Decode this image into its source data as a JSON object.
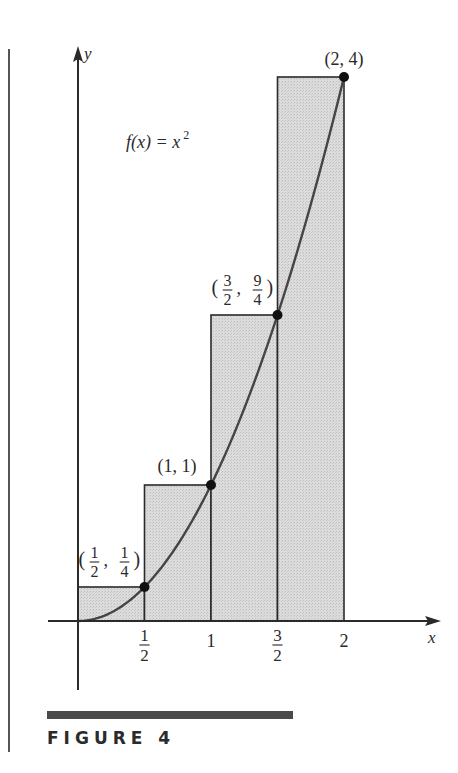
{
  "figure": {
    "caption": "FIGURE 4",
    "function_label": "f(x) = x²",
    "function_label_parts": {
      "lhs": "f(x) = x",
      "exp": "2"
    },
    "axis_labels": {
      "x": "x",
      "y": "y"
    },
    "colors": {
      "fill": "#d6d6d6",
      "stroke": "#2a2a2a",
      "curve": "#444444",
      "bar": "#4a4a4a"
    }
  },
  "chart_data": {
    "type": "area",
    "title": "",
    "function": "f(x) = x^2",
    "xlabel": "x",
    "ylabel": "y",
    "xlim": [
      0,
      2
    ],
    "ylim": [
      0,
      4
    ],
    "grid": false,
    "legend": null,
    "x_ticks": [
      {
        "value": 0.5,
        "num": "1",
        "den": "2"
      },
      {
        "value": 1,
        "label": "1"
      },
      {
        "value": 1.5,
        "num": "3",
        "den": "2"
      },
      {
        "value": 2,
        "label": "2"
      }
    ],
    "rectangles": [
      {
        "x0": 0,
        "x1": 0.5,
        "height": 0.25
      },
      {
        "x0": 0.5,
        "x1": 1,
        "height": 1
      },
      {
        "x0": 1,
        "x1": 1.5,
        "height": 2.25
      },
      {
        "x0": 1.5,
        "x1": 2,
        "height": 4
      }
    ],
    "points": [
      {
        "x": 0.5,
        "y": 0.25,
        "label": "(1/2, 1/4)",
        "lx": {
          "num": "1",
          "den": "2"
        },
        "ly": {
          "num": "1",
          "den": "4"
        }
      },
      {
        "x": 1,
        "y": 1,
        "label": "(1, 1)"
      },
      {
        "x": 1.5,
        "y": 2.25,
        "label": "(3/2, 9/4)",
        "lx": {
          "num": "3",
          "den": "2"
        },
        "ly": {
          "num": "9",
          "den": "4"
        }
      },
      {
        "x": 2,
        "y": 4,
        "label": "(2, 4)"
      }
    ]
  }
}
